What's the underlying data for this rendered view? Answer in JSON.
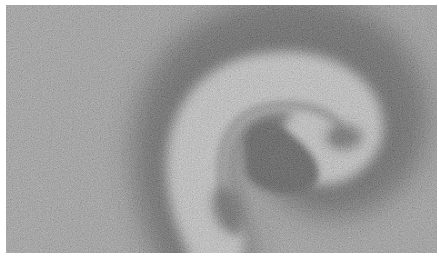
{
  "image": {
    "description": "Grayscale noisy micrograph-like image of a curved hook/spiral band",
    "colors": {
      "background": "#8a8a8a",
      "dark_halo": "#2a2a2a",
      "bright_band": "#c8c8c8",
      "inner_groove": "#6e6e6e",
      "core": "#151515",
      "border": "#ffffff"
    }
  }
}
